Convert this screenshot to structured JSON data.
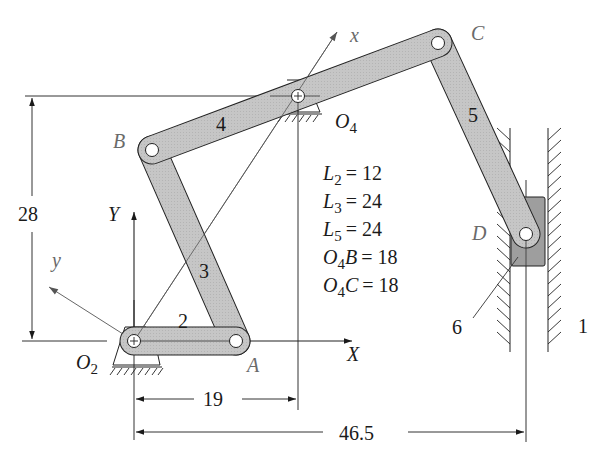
{
  "diagram": {
    "type": "mechanism-kinematic-diagram",
    "title": "",
    "links": [
      {
        "id": "1",
        "label": "1",
        "description": "ground / frame with vertical guide"
      },
      {
        "id": "2",
        "label": "2",
        "description": "crank O2-A",
        "length": "L2 = 12"
      },
      {
        "id": "3",
        "label": "3",
        "description": "coupler A-B",
        "length": "L3 = 24"
      },
      {
        "id": "4",
        "label": "4",
        "description": "ternary rocker B-O4-C"
      },
      {
        "id": "5",
        "label": "5",
        "description": "connecting rod C-D",
        "length": "L5 = 24"
      },
      {
        "id": "6",
        "label": "6",
        "description": "slider at D in vertical guide"
      }
    ],
    "points": {
      "O2": "O2",
      "O4": "O4",
      "A": "A",
      "B": "B",
      "C": "C",
      "D": "D"
    },
    "axes": {
      "X": "X",
      "Y": "Y",
      "x": "x",
      "y": "y"
    },
    "given": [
      {
        "name": "L2",
        "sub": "2",
        "base": "L",
        "value": "12",
        "text": "= 12"
      },
      {
        "name": "L3",
        "sub": "3",
        "base": "L",
        "value": "24",
        "text": "= 24"
      },
      {
        "name": "L5",
        "sub": "5",
        "base": "L",
        "value": "24",
        "text": "= 24"
      },
      {
        "name": "O4B",
        "sub": "4",
        "base": "O",
        "suffix": "B",
        "value": "18",
        "text": "= 18"
      },
      {
        "name": "O4C",
        "sub": "4",
        "base": "O",
        "suffix": "C",
        "value": "18",
        "text": "= 18"
      }
    ],
    "dimensions": {
      "vertical": "28",
      "horizontal_o4": "19",
      "horizontal_slider": "46.5"
    },
    "colors": {
      "link_fill": "#c4c4c4",
      "slider_fill": "#9a9a9a",
      "stroke": "#222222",
      "thin": "#555555"
    }
  }
}
